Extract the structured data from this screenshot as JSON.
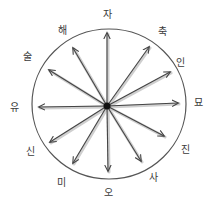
{
  "diagram": {
    "type": "radial-compass",
    "center": {
      "x": 107,
      "y": 106
    },
    "circle": {
      "cx": 109,
      "cy": 104,
      "rx": 77,
      "ry": 75,
      "stroke": "#555555"
    },
    "arrow_color": "#444444",
    "arrow_shadow_color": "#bbbbbb",
    "hub_color": "#111111",
    "branches": [
      {
        "label": "자",
        "tip": {
          "x": 107,
          "y": 33
        },
        "label_pos": {
          "x": 107,
          "y": 15
        }
      },
      {
        "label": "축",
        "tip": {
          "x": 149,
          "y": 47
        },
        "label_pos": {
          "x": 162,
          "y": 32
        }
      },
      {
        "label": "인",
        "tip": {
          "x": 170,
          "y": 72
        },
        "label_pos": {
          "x": 180,
          "y": 63
        }
      },
      {
        "label": "묘",
        "tip": {
          "x": 178,
          "y": 103
        },
        "label_pos": {
          "x": 198,
          "y": 103
        }
      },
      {
        "label": "진",
        "tip": {
          "x": 164,
          "y": 136
        },
        "label_pos": {
          "x": 185,
          "y": 150
        }
      },
      {
        "label": "사",
        "tip": {
          "x": 141,
          "y": 161
        },
        "label_pos": {
          "x": 153,
          "y": 178
        }
      },
      {
        "label": "오",
        "tip": {
          "x": 108,
          "y": 171
        },
        "label_pos": {
          "x": 108,
          "y": 193
        }
      },
      {
        "label": "미",
        "tip": {
          "x": 73,
          "y": 163
        },
        "label_pos": {
          "x": 61,
          "y": 183
        }
      },
      {
        "label": "신",
        "tip": {
          "x": 50,
          "y": 142
        },
        "label_pos": {
          "x": 30,
          "y": 152
        }
      },
      {
        "label": "유",
        "tip": {
          "x": 39,
          "y": 107
        },
        "label_pos": {
          "x": 14,
          "y": 108
        }
      },
      {
        "label": "술",
        "tip": {
          "x": 49,
          "y": 70
        },
        "label_pos": {
          "x": 27,
          "y": 57
        }
      },
      {
        "label": "해",
        "tip": {
          "x": 73,
          "y": 48
        },
        "label_pos": {
          "x": 62,
          "y": 31
        }
      }
    ]
  }
}
